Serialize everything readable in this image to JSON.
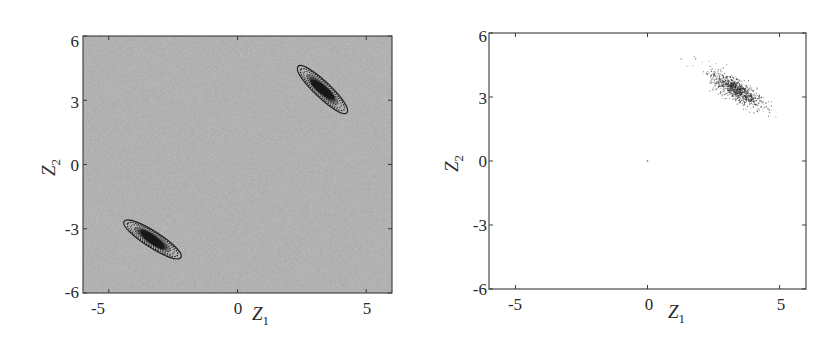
{
  "figure": {
    "panels": [
      {
        "id": "left",
        "kind": "contour",
        "xlabel": "Z",
        "xlabel_sub": "1",
        "ylabel": "Z",
        "ylabel_sub": "2",
        "xticks": [
          "-5",
          "0",
          "5"
        ],
        "yticks": [
          "6",
          "3",
          "0",
          "-3",
          "-6"
        ],
        "background": "#a9a9a9"
      },
      {
        "id": "right",
        "kind": "scatter",
        "xlabel": "Z",
        "xlabel_sub": "1",
        "ylabel": "Z",
        "ylabel_sub": "2",
        "xticks": [
          "-5",
          "0",
          "5"
        ],
        "yticks": [
          "6",
          "3",
          "0",
          "-3",
          "-6"
        ],
        "background": "#ffffff"
      }
    ]
  },
  "chart_data": [
    {
      "type": "heatmap",
      "title": "",
      "xlabel": "Z1",
      "ylabel": "Z2",
      "xlim": [
        -6,
        6
      ],
      "ylim": [
        -6,
        6
      ],
      "xticks": [
        -5,
        0,
        5
      ],
      "yticks": [
        -6,
        -3,
        0,
        3,
        6
      ],
      "grid": false,
      "legend": null,
      "description": "Contour plot of a bimodal density on a uniform gray background; two elongated, negatively-correlated modes symmetric about the origin",
      "modes": [
        {
          "center": [
            3.3,
            3.5
          ],
          "x_extent": [
            2.4,
            4.5
          ],
          "y_extent": [
            2.5,
            4.7
          ],
          "orientation": "negative-slope",
          "levels": 8
        },
        {
          "center": [
            -3.3,
            -3.5
          ],
          "x_extent": [
            -4.5,
            -2.4
          ],
          "y_extent": [
            -4.7,
            -2.5
          ],
          "orientation": "negative-slope",
          "levels": 8
        }
      ]
    },
    {
      "type": "scatter",
      "title": "",
      "xlabel": "Z1",
      "ylabel": "Z2",
      "xlim": [
        -6,
        6
      ],
      "ylim": [
        -6,
        6
      ],
      "xticks": [
        -5,
        0,
        5
      ],
      "yticks": [
        -6,
        -3,
        0,
        3,
        6
      ],
      "grid": false,
      "legend": null,
      "description": "Sample points concentrated in a single elongated cluster in the upper-right mode; a lone point near the origin",
      "clusters": [
        {
          "center": [
            3.3,
            3.4
          ],
          "x_extent": [
            2.0,
            5.0
          ],
          "y_extent": [
            2.0,
            5.2
          ],
          "orientation": "negative-slope",
          "approx_points": 900
        },
        {
          "center": [
            0,
            0
          ],
          "approx_points": 1
        }
      ]
    }
  ]
}
